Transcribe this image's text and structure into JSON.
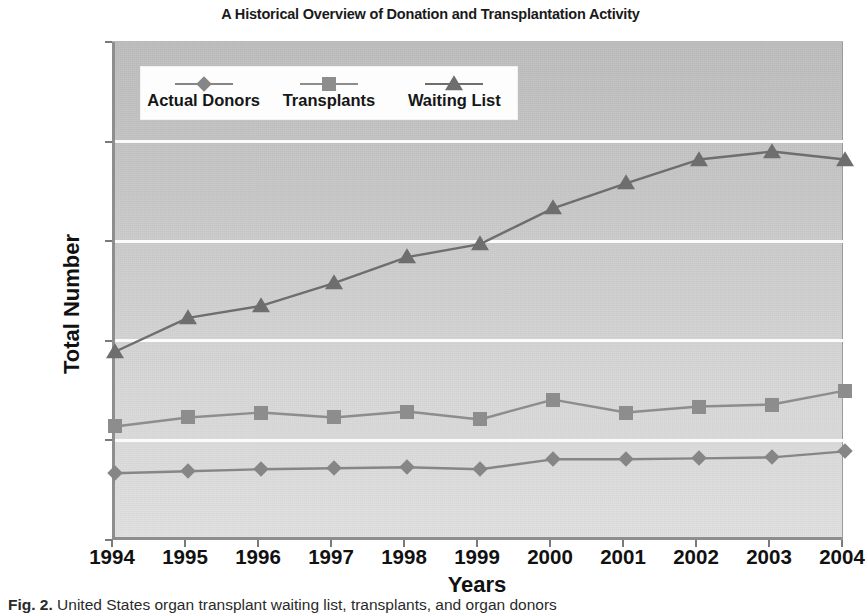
{
  "chart_data": {
    "type": "line",
    "title": "A Historical Overview of Donation and Transplantation Activity",
    "xlabel": "Years",
    "ylabel": "Total Number",
    "categories": [
      "1994",
      "1995",
      "1996",
      "1997",
      "1998",
      "1999",
      "2000",
      "2001",
      "2002",
      "2003",
      "2004"
    ],
    "ylim": [
      0,
      2500
    ],
    "yticks": [
      0,
      500,
      1000,
      1500,
      2000,
      2500
    ],
    "grid": true,
    "legend_position": "top-left-inside",
    "series": [
      {
        "name": "Actual Donors",
        "marker": "diamond",
        "color": "#868686",
        "values": [
          335,
          345,
          355,
          360,
          365,
          355,
          405,
          405,
          410,
          415,
          445
        ]
      },
      {
        "name": "Transplants",
        "marker": "square",
        "color": "#8d8d8d",
        "values": [
          570,
          615,
          640,
          615,
          645,
          605,
          705,
          640,
          670,
          680,
          750
        ]
      },
      {
        "name": "Waiting List",
        "marker": "triangle",
        "color": "#6e6e6e",
        "values": [
          945,
          1115,
          1175,
          1290,
          1420,
          1485,
          1665,
          1790,
          1910,
          1950,
          1910
        ]
      }
    ]
  },
  "caption": {
    "figure_number": "Fig. 2.",
    "text": "United States organ transplant waiting list, transplants, and organ donors"
  }
}
